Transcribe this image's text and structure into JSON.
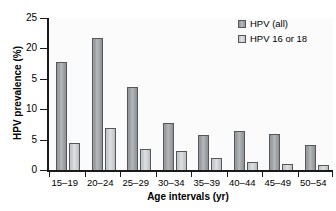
{
  "chart_data": {
    "type": "bar",
    "title": "",
    "xlabel": "Age intervals (yr)",
    "ylabel": "HPV prevalence (%)",
    "categories": [
      "15–19",
      "20–24",
      "25–29",
      "30–34",
      "35–39",
      "40–44",
      "45–49",
      "50–54"
    ],
    "series": [
      {
        "name": "HPV (all)",
        "color": "#9a9da0",
        "values": [
          17.8,
          21.7,
          13.7,
          7.7,
          5.8,
          6.4,
          6.0,
          4.1
        ]
      },
      {
        "name": "HPV 16 or 18",
        "color": "#c7cacc",
        "values": [
          4.4,
          6.9,
          3.5,
          3.1,
          1.9,
          1.3,
          1.0,
          0.9
        ]
      }
    ],
    "ylim": [
      0,
      25
    ],
    "yticks": [
      0,
      5,
      10,
      15,
      20,
      25
    ],
    "ytick_labels": [
      "0",
      "5",
      "10",
      "5",
      "20",
      "25"
    ],
    "grid": false,
    "legend_position": "top-right"
  },
  "legend": {
    "items": [
      {
        "label": "HPV (all)"
      },
      {
        "label": "HPV 16 or 18"
      }
    ]
  },
  "colors": {
    "axis": "#1a1a1a",
    "plot_background": "#fbfbfb",
    "series_all": "#9a9da0",
    "series_1618": "#c7cacc"
  }
}
